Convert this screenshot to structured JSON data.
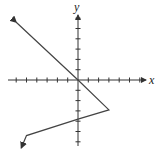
{
  "chart_data": {
    "type": "line",
    "title": "",
    "xlabel": "x",
    "ylabel": "y",
    "xlim": [
      -7,
      7
    ],
    "ylim": [
      -6,
      6
    ],
    "grid": false,
    "legend": null,
    "tick_spacing": 1,
    "tick_labels": false,
    "series": [
      {
        "name": "graph",
        "points": [
          [
            -6,
            5.6
          ],
          [
            0,
            0
          ],
          [
            3,
            -2.9
          ],
          [
            0,
            -3.8
          ],
          [
            -5,
            -5.4
          ],
          [
            -5.5,
            -6.6
          ]
        ],
        "arrow_start": true,
        "arrow_end": true
      }
    ]
  },
  "axes": {
    "x_label": "x",
    "y_label": "y"
  },
  "colors": {
    "axis": "#333333",
    "line": "#444444"
  }
}
